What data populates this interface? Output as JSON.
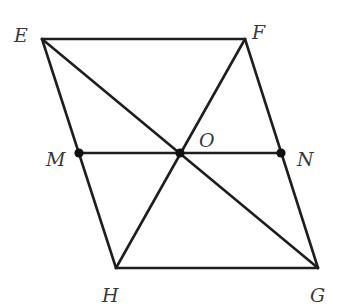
{
  "diagram": {
    "type": "geometry",
    "colors": {
      "stroke": "#1e1e1e",
      "label": "#3a3a3a",
      "background": "#ffffff"
    },
    "points": {
      "E": {
        "label": "E",
        "x": 42,
        "y": 39
      },
      "F": {
        "label": "F",
        "x": 245,
        "y": 39
      },
      "G": {
        "label": "G",
        "x": 318,
        "y": 268
      },
      "H": {
        "label": "H",
        "x": 116,
        "y": 268
      },
      "O": {
        "label": "O",
        "x": 180,
        "y": 153
      },
      "M": {
        "label": "M",
        "x": 79,
        "y": 153
      },
      "N": {
        "label": "N",
        "x": 281,
        "y": 153
      }
    },
    "segments": [
      {
        "from": "E",
        "to": "F"
      },
      {
        "from": "F",
        "to": "G"
      },
      {
        "from": "G",
        "to": "H"
      },
      {
        "from": "H",
        "to": "E"
      },
      {
        "from": "E",
        "to": "G"
      },
      {
        "from": "F",
        "to": "H"
      },
      {
        "from": "M",
        "to": "N"
      }
    ],
    "marked_points": [
      "M",
      "O",
      "N"
    ],
    "labels": {
      "E": "E",
      "F": "F",
      "G": "G",
      "H": "H",
      "O": "O",
      "M": "M",
      "N": "N"
    }
  }
}
